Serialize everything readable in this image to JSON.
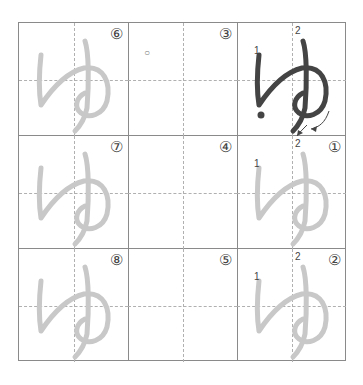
{
  "worksheet": {
    "character": "ゆ",
    "colors": {
      "trace": "#c8c8c8",
      "model": "#444444",
      "border": "#8a8a8a",
      "guide": "#b0b0b0"
    },
    "cells": [
      {
        "row": 0,
        "col": 0,
        "badge": "⑥",
        "type": "trace"
      },
      {
        "row": 0,
        "col": 1,
        "badge": "③",
        "type": "dot",
        "mark": "○"
      },
      {
        "row": 0,
        "col": 2,
        "badge": "",
        "type": "model",
        "stroke_labels": [
          "1",
          "2"
        ]
      },
      {
        "row": 1,
        "col": 0,
        "badge": "⑦",
        "type": "trace"
      },
      {
        "row": 1,
        "col": 1,
        "badge": "④",
        "type": "blank"
      },
      {
        "row": 1,
        "col": 2,
        "badge": "①",
        "type": "trace",
        "stroke_labels": [
          "1",
          "2"
        ]
      },
      {
        "row": 2,
        "col": 0,
        "badge": "⑧",
        "type": "trace"
      },
      {
        "row": 2,
        "col": 1,
        "badge": "⑤",
        "type": "blank"
      },
      {
        "row": 2,
        "col": 2,
        "badge": "②",
        "type": "trace",
        "stroke_labels": [
          "1",
          "2"
        ]
      }
    ]
  }
}
